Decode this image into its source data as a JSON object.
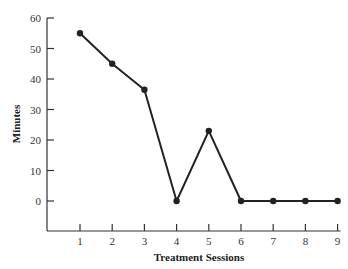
{
  "chart_data": {
    "type": "line",
    "title": "",
    "xlabel": "Treatment Sessions",
    "ylabel": "Minutes",
    "categories": [
      "1",
      "2",
      "3",
      "4",
      "5",
      "6",
      "7",
      "8",
      "9"
    ],
    "x": [
      1,
      2,
      3,
      4,
      5,
      6,
      7,
      8,
      9
    ],
    "series": [
      {
        "name": "Minutes",
        "values": [
          55,
          45,
          36.5,
          0,
          23,
          0,
          0,
          0,
          0
        ]
      }
    ],
    "yticks": [
      0,
      10,
      20,
      30,
      40,
      50,
      60
    ],
    "xticks": [
      1,
      2,
      3,
      4,
      5,
      6,
      7,
      8,
      9
    ],
    "ylim": [
      -10,
      60
    ],
    "xlim": [
      0,
      9
    ],
    "grid": false,
    "legend": "none",
    "line_color": "#222222",
    "marker": "filled-circle"
  }
}
